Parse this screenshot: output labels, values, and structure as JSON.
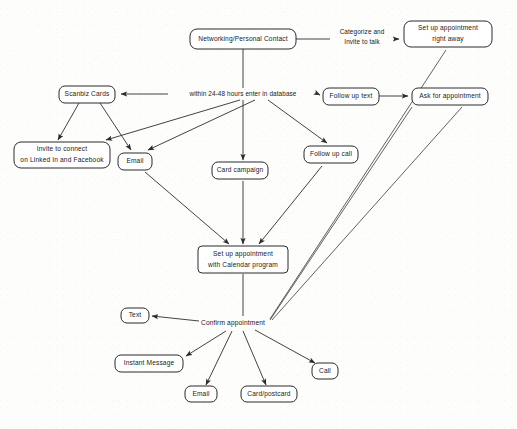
{
  "diagram": {
    "type": "flowchart",
    "background_color": "#fdfdfc",
    "stroke_color": "#2b2b2b",
    "text_color": "#1a1a1a",
    "nodes": [
      {
        "id": "networking",
        "label": "Networking/Personal Contact",
        "shape": "rounded-rect",
        "x": 243,
        "y": 39,
        "w": 106,
        "h": 20
      },
      {
        "id": "setup_right_away",
        "label": "Set up appointment\nright away",
        "shape": "rounded-rect",
        "x": 448,
        "y": 34,
        "w": 88,
        "h": 26
      },
      {
        "id": "scanbiz",
        "label": "Scanbiz Cards",
        "shape": "rounded-rect",
        "x": 87,
        "y": 94,
        "w": 56,
        "h": 17
      },
      {
        "id": "follow_up_text",
        "label": "Follow up text",
        "shape": "rounded-rect",
        "x": 351,
        "y": 96,
        "w": 56,
        "h": 17
      },
      {
        "id": "ask_appointment",
        "label": "Ask for appointment",
        "shape": "rounded-rect",
        "x": 450,
        "y": 96,
        "w": 76,
        "h": 17
      },
      {
        "id": "invite_connect",
        "label": "Invite to connect\non Linked In and Facebook",
        "shape": "rounded-rect",
        "x": 54,
        "y": 155,
        "w": 96,
        "h": 26
      },
      {
        "id": "email_mid",
        "label": "Email",
        "shape": "rounded-rect",
        "x": 135,
        "y": 161,
        "w": 34,
        "h": 17
      },
      {
        "id": "card_campaign",
        "label": "Card campaign",
        "shape": "rounded-rect",
        "x": 240,
        "y": 171,
        "w": 56,
        "h": 17
      },
      {
        "id": "follow_up_call",
        "label": "Follow up call",
        "shape": "rounded-rect",
        "x": 331,
        "y": 155,
        "w": 54,
        "h": 17
      },
      {
        "id": "setup_calendar",
        "label": "Set up appointment\nwith Calendar program",
        "shape": "rounded-rect",
        "x": 243,
        "y": 259,
        "w": 90,
        "h": 26
      },
      {
        "id": "confirm",
        "label": "Confirm appointment",
        "shape": "plain-text",
        "x": 233,
        "y": 323,
        "w": 76,
        "h": 12
      },
      {
        "id": "text_node",
        "label": "Text",
        "shape": "rounded-rect",
        "x": 135,
        "y": 315,
        "w": 28,
        "h": 15
      },
      {
        "id": "instant_message",
        "label": "Instant Message",
        "shape": "rounded-rect",
        "x": 149,
        "y": 363,
        "w": 68,
        "h": 17
      },
      {
        "id": "email_bottom",
        "label": "Email",
        "shape": "rounded-rect",
        "x": 201,
        "y": 394,
        "w": 32,
        "h": 16
      },
      {
        "id": "card_postcard",
        "label": "Card/postcard",
        "shape": "rounded-rect",
        "x": 269,
        "y": 394,
        "w": 56,
        "h": 16
      },
      {
        "id": "call_node",
        "label": "Call",
        "shape": "rounded-rect",
        "x": 325,
        "y": 371,
        "w": 26,
        "h": 16
      }
    ],
    "edge_labels": [
      {
        "id": "categorize",
        "label": "Categorize and\nInvite to talk",
        "x": 362,
        "y": 37
      },
      {
        "id": "within_hours",
        "label": "within 24-48 hours enter in database",
        "x": 243,
        "y": 94
      }
    ],
    "edges": [
      {
        "from": "networking",
        "to": "setup_right_away",
        "via_label": "categorize",
        "arrow": true
      },
      {
        "from": "networking",
        "to": "within_hours",
        "via_label": "within_hours",
        "arrow": false
      },
      {
        "from": "within_hours",
        "to": "scanbiz",
        "arrow": true
      },
      {
        "from": "within_hours",
        "to": "follow_up_text",
        "arrow": true
      },
      {
        "from": "follow_up_text",
        "to": "ask_appointment",
        "arrow": true
      },
      {
        "from": "scanbiz",
        "to": "invite_connect",
        "arrow": true
      },
      {
        "from": "scanbiz",
        "to": "email_mid",
        "arrow": true
      },
      {
        "from": "networking",
        "to": "card_campaign",
        "arrow": true
      },
      {
        "from": "networking",
        "to": "follow_up_call",
        "arrow": true
      },
      {
        "from": "networking",
        "to": "invite_connect",
        "arrow": true
      },
      {
        "from": "networking",
        "to": "email_mid",
        "arrow": true
      },
      {
        "from": "email_mid",
        "to": "setup_calendar",
        "arrow": true
      },
      {
        "from": "card_campaign",
        "to": "setup_calendar",
        "arrow": true
      },
      {
        "from": "follow_up_call",
        "to": "setup_calendar",
        "arrow": true
      },
      {
        "from": "setup_calendar",
        "to": "confirm",
        "arrow": false
      },
      {
        "from": "setup_right_away",
        "to": "confirm",
        "arrow": false
      },
      {
        "from": "follow_up_text",
        "to": "confirm",
        "arrow": false
      },
      {
        "from": "ask_appointment",
        "to": "confirm",
        "arrow": false
      },
      {
        "from": "confirm",
        "to": "text_node",
        "arrow": true
      },
      {
        "from": "confirm",
        "to": "instant_message",
        "arrow": true
      },
      {
        "from": "confirm",
        "to": "email_bottom",
        "arrow": true
      },
      {
        "from": "confirm",
        "to": "card_postcard",
        "arrow": true
      },
      {
        "from": "confirm",
        "to": "call_node",
        "arrow": true
      }
    ]
  }
}
